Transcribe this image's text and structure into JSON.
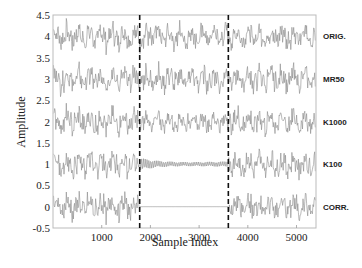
{
  "chart_data": {
    "type": "line",
    "title": "",
    "xlabel": "Sample Index",
    "ylabel": "Amplitude",
    "xlim": [
      0,
      5400
    ],
    "ylim": [
      -0.5,
      4.5
    ],
    "xticks": [
      1000,
      2000,
      3000,
      4000,
      5000
    ],
    "yticks": [
      -0.5,
      0,
      0.5,
      1,
      1.5,
      2,
      2.5,
      3,
      3.5,
      4,
      4.5
    ],
    "ytick_labels": [
      "-0.5",
      "0",
      "0.5",
      "1",
      "1.5",
      "2",
      "2.5",
      "3",
      "3.5",
      "4",
      "4.5"
    ],
    "grid": false,
    "legend": "right-side labels per trace",
    "vertical_markers": [
      1780,
      3600
    ],
    "gap_region": [
      1780,
      3600
    ],
    "series": [
      {
        "name": "ORIG.",
        "offset": 4,
        "amplitude": 0.3,
        "gap_behavior": "signal"
      },
      {
        "name": "MR50",
        "offset": 3,
        "amplitude": 0.3,
        "gap_behavior": "signal"
      },
      {
        "name": "K1000",
        "offset": 2,
        "amplitude": 0.3,
        "gap_behavior": "reduced-signal"
      },
      {
        "name": "K100",
        "offset": 1,
        "amplitude": 0.3,
        "gap_behavior": "decaying-oscillation"
      },
      {
        "name": "CORR.",
        "offset": 0,
        "amplitude": 0.3,
        "gap_behavior": "flat-zero"
      }
    ]
  },
  "colors": {
    "trace": "#8a8a8a",
    "axis": "#bbbbbb",
    "marker": "#111111"
  }
}
